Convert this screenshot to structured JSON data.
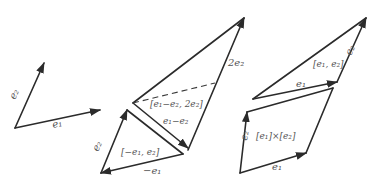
{
  "figures": {
    "basis": {
      "e1_label": "e₁",
      "e2_label": "e₂"
    },
    "decomposition": {
      "lower_triangle_label": "[−e₁, e₂]",
      "neg_e1_label": "−e₁",
      "e2_label": "e₂",
      "diff_label": "e₁−e₂",
      "upper_triangle_label": "[e₁−e₂, 2e₂]",
      "two_e2_label": "2e₂"
    },
    "product": {
      "triangle_label": "[e₁, e₂]",
      "tri_e1_label": "e₁",
      "tri_e2_label": "e₂",
      "parallelogram_label": "[e₁]×[e₂]",
      "par_e1_label": "e₁",
      "par_e2_label": "e₂"
    }
  },
  "colors": {
    "stroke": "#2b2b2b",
    "label": "#555555",
    "background": "#ffffff"
  }
}
